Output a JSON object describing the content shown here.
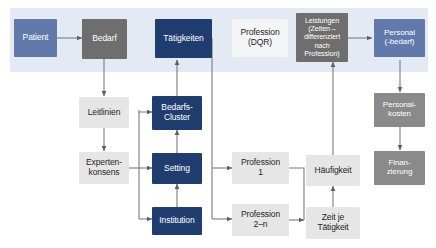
{
  "diagram": {
    "colors": {
      "band": "#e3eaf3",
      "dark_blue": "#1f3d6e",
      "mid_blue": "#6279ab",
      "dark_gray": "#6e6e6e",
      "mid_gray": "#8a8a8a",
      "light_gray": "#e6e6e6",
      "white_box": "#f4f5f7",
      "connector": "#6b6b6b"
    },
    "nodes": {
      "patient": "Patient",
      "bedarf": "Bedarf",
      "taetigkeiten": "Tätigkeiten",
      "profession_dqr_l1": "Profession",
      "profession_dqr_l2": "(DQR)",
      "leistungen_l1": "Leistungen",
      "leistungen_l2": "(Zeiten –",
      "leistungen_l3": "differenziert",
      "leistungen_l4": "nach Profession)",
      "personal_l1": "Personal",
      "personal_l2": "(-bedarf)",
      "leitlinien": "Leitlinien",
      "bedarfs_cluster_l1": "Bedarfs-",
      "bedarfs_cluster_l2": "Cluster",
      "personalkosten_l1": "Personal-",
      "personalkosten_l2": "kosten",
      "experten_l1": "Experten-",
      "experten_l2": "konsens",
      "setting": "Setting",
      "profession_1_l1": "Profession",
      "profession_1_l2": "1",
      "haeufigkeit": "Häufigkeit",
      "finanzierung_l1": "Finan-",
      "finanzierung_l2": "zierung",
      "institution": "Institution",
      "profession_2n_l1": "Profession",
      "profession_2n_l2": "2–n",
      "zeit_je_l1": "Zeit je",
      "zeit_je_l2": "Tätigkeit"
    }
  }
}
